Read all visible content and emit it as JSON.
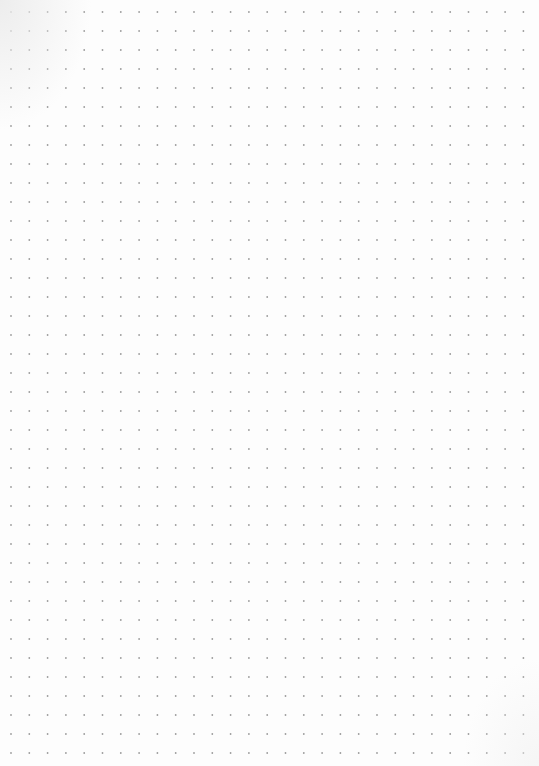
{
  "page": {
    "type": "dot-grid-sheet",
    "width": 539,
    "height": 766,
    "background_color": "#fdfdfd",
    "dot_color": "#9c9c9c",
    "dot_radius": 0.9,
    "grid": {
      "origin_x": 11,
      "origin_y": 12,
      "spacing_x": 18.3,
      "spacing_y": 19,
      "columns": 29,
      "rows": 40
    }
  }
}
